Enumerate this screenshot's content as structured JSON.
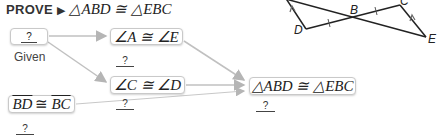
{
  "prove": {
    "keyword": "PROVE",
    "arrow": "▶",
    "statement": "△ABD ≅ △EBC"
  },
  "flow": {
    "box_given": {
      "statement": "?",
      "reason": "Given"
    },
    "box_angle_ae": {
      "statement": "∠A ≅ ∠E",
      "reason": "?"
    },
    "box_angle_cd": {
      "statement": "∠C ≅ ∠D",
      "reason": "?"
    },
    "box_segments": {
      "seg1": "BD",
      "symbol": "≅",
      "seg2": "BC",
      "reason": "?"
    },
    "box_conclusion": {
      "statement": "△ABD ≅ △EBC",
      "reason": "?"
    }
  },
  "diagram": {
    "labels": {
      "B": "B",
      "C": "C",
      "D": "D",
      "E": "E"
    }
  },
  "colors": {
    "arrow": "#b5b5b5",
    "box_border": "#c9c9c9",
    "diagram_line": "#222222"
  }
}
